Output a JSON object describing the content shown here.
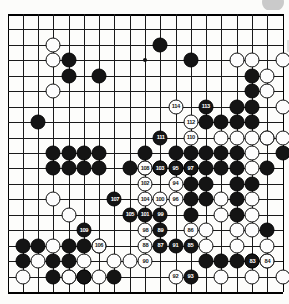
{
  "page": {
    "type": "go-board-diagram",
    "board_size": 19,
    "colors": {
      "black_stone": "#141414",
      "white_stone": "#fdfdfd",
      "line": "#1a1a1a",
      "background": "#fdfdfb",
      "black_label_text": "#ffffff",
      "white_label_text": "#1a1a1a"
    }
  },
  "board": {
    "size": 19,
    "star_points": [
      [
        3,
        3
      ],
      [
        9,
        3
      ],
      [
        15,
        3
      ],
      [
        3,
        9
      ],
      [
        9,
        9
      ],
      [
        15,
        9
      ],
      [
        3,
        15
      ],
      [
        9,
        15
      ],
      [
        15,
        15
      ]
    ],
    "black_stones": [
      [
        3,
        9
      ],
      [
        4,
        9
      ],
      [
        5,
        9
      ],
      [
        6,
        9
      ],
      [
        9,
        9
      ],
      [
        11,
        9
      ],
      [
        12,
        9
      ],
      [
        13,
        9
      ],
      [
        14,
        9
      ],
      [
        15,
        9
      ],
      [
        4,
        16
      ],
      [
        4,
        17
      ],
      [
        5,
        17
      ],
      [
        7,
        17
      ],
      [
        3,
        10
      ],
      [
        4,
        10
      ],
      [
        5,
        10
      ],
      [
        6,
        10
      ],
      [
        8,
        10
      ],
      [
        9,
        10
      ],
      [
        10,
        10
      ],
      [
        11,
        10
      ],
      [
        12,
        10
      ],
      [
        13,
        10
      ],
      [
        14,
        10
      ],
      [
        15,
        10
      ],
      [
        12,
        3
      ],
      [
        16,
        4
      ],
      [
        16,
        5
      ],
      [
        15,
        6
      ],
      [
        16,
        6
      ],
      [
        13,
        7
      ],
      [
        14,
        7
      ],
      [
        15,
        7
      ],
      [
        16,
        7
      ],
      [
        18,
        9
      ],
      [
        17,
        10
      ],
      [
        12,
        11
      ],
      [
        13,
        11
      ],
      [
        15,
        11
      ],
      [
        16,
        11
      ],
      [
        12,
        12
      ],
      [
        13,
        12
      ],
      [
        15,
        12
      ],
      [
        12,
        13
      ],
      [
        15,
        13
      ],
      [
        17,
        14
      ],
      [
        2,
        7
      ],
      [
        4,
        3
      ],
      [
        4,
        4
      ],
      [
        6,
        4
      ],
      [
        10,
        2
      ],
      [
        1,
        15
      ],
      [
        2,
        15
      ],
      [
        1,
        16
      ],
      [
        3,
        16
      ],
      [
        3,
        17
      ],
      [
        5,
        17
      ],
      [
        4,
        15
      ],
      [
        5,
        15
      ],
      [
        6,
        15
      ],
      [
        13,
        16
      ],
      [
        14,
        16
      ],
      [
        15,
        16
      ],
      [
        16,
        16
      ]
    ],
    "white_stones": [
      [
        3,
        2
      ],
      [
        3,
        3
      ],
      [
        3,
        5
      ],
      [
        3,
        12
      ],
      [
        15,
        3
      ],
      [
        16,
        3
      ],
      [
        18,
        3
      ],
      [
        17,
        4
      ],
      [
        17,
        5
      ],
      [
        18,
        6
      ],
      [
        17,
        8
      ],
      [
        18,
        8
      ],
      [
        14,
        8
      ],
      [
        15,
        8
      ],
      [
        16,
        8
      ],
      [
        17,
        8
      ],
      [
        14,
        12
      ],
      [
        16,
        12
      ],
      [
        14,
        13
      ],
      [
        16,
        13
      ],
      [
        17,
        15
      ],
      [
        17,
        16
      ],
      [
        4,
        13
      ],
      [
        2,
        16
      ],
      [
        3,
        15
      ],
      [
        4,
        17
      ],
      [
        5,
        16
      ],
      [
        7,
        16
      ],
      [
        8,
        16
      ],
      [
        1,
        17
      ],
      [
        6,
        17
      ],
      [
        16,
        17
      ],
      [
        18,
        17
      ],
      [
        16,
        9
      ],
      [
        16,
        10
      ],
      [
        16,
        14
      ],
      [
        13,
        14
      ],
      [
        13,
        15
      ],
      [
        15,
        14
      ],
      [
        15,
        15
      ],
      [
        14,
        17
      ]
    ],
    "move_markers": [
      {
        "n": 83,
        "col": 16,
        "row": 16,
        "color": "b"
      },
      {
        "n": 84,
        "col": 17,
        "row": 16,
        "color": "w"
      },
      {
        "n": 85,
        "col": 12,
        "row": 15,
        "color": "b"
      },
      {
        "n": 86,
        "col": 12,
        "row": 14,
        "color": "w"
      },
      {
        "n": 87,
        "col": 10,
        "row": 15,
        "color": "b"
      },
      {
        "n": 88,
        "col": 9,
        "row": 15,
        "color": "w"
      },
      {
        "n": 89,
        "col": 10,
        "row": 14,
        "color": "b"
      },
      {
        "n": 90,
        "col": 9,
        "row": 16,
        "color": "w"
      },
      {
        "n": 91,
        "col": 11,
        "row": 15,
        "color": "b"
      },
      {
        "n": 92,
        "col": 11,
        "row": 17,
        "color": "w"
      },
      {
        "n": 93,
        "col": 12,
        "row": 17,
        "color": "b"
      },
      {
        "n": 94,
        "col": 11,
        "row": 11,
        "color": "w"
      },
      {
        "n": 95,
        "col": 11,
        "row": 10,
        "color": "b"
      },
      {
        "n": 96,
        "col": 11,
        "row": 12,
        "color": "w"
      },
      {
        "n": 97,
        "col": 12,
        "row": 10,
        "color": "b"
      },
      {
        "n": 98,
        "col": 9,
        "row": 14,
        "color": "w"
      },
      {
        "n": 99,
        "col": 10,
        "row": 13,
        "color": "b"
      },
      {
        "n": 100,
        "col": 10,
        "row": 12,
        "color": "w"
      },
      {
        "n": 101,
        "col": 9,
        "row": 13,
        "color": "b"
      },
      {
        "n": 102,
        "col": 9,
        "row": 11,
        "color": "w"
      },
      {
        "n": 103,
        "col": 10,
        "row": 10,
        "color": "b"
      },
      {
        "n": 104,
        "col": 9,
        "row": 12,
        "color": "w"
      },
      {
        "n": 105,
        "col": 8,
        "row": 13,
        "color": "b"
      },
      {
        "n": 106,
        "col": 6,
        "row": 15,
        "color": "w"
      },
      {
        "n": 107,
        "col": 7,
        "row": 12,
        "color": "b"
      },
      {
        "n": 108,
        "col": 9,
        "row": 10,
        "color": "w"
      },
      {
        "n": 109,
        "col": 5,
        "row": 14,
        "color": "b"
      },
      {
        "n": 110,
        "col": 12,
        "row": 8,
        "color": "w"
      },
      {
        "n": 111,
        "col": 10,
        "row": 8,
        "color": "b"
      },
      {
        "n": 112,
        "col": 12,
        "row": 7,
        "color": "w"
      },
      {
        "n": 113,
        "col": 13,
        "row": 6,
        "color": "b"
      },
      {
        "n": 114,
        "col": 11,
        "row": 6,
        "color": "w"
      }
    ]
  }
}
